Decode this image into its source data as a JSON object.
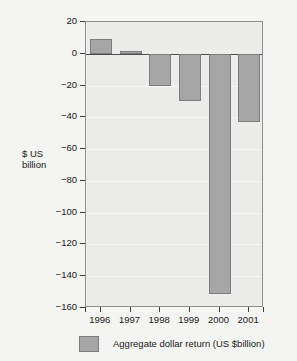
{
  "chart_data": {
    "type": "bar",
    "title": "",
    "xlabel": "",
    "ylabel": "$ US\nbillion",
    "ylabel_line1": "$ US",
    "ylabel_line2": "billion",
    "categories": [
      "1996",
      "1997",
      "1998",
      "1999",
      "2000",
      "2001"
    ],
    "values": [
      9,
      2,
      -20,
      -30,
      -151,
      -43
    ],
    "series": [
      {
        "name": "Aggregate dollar return (US $billion)",
        "values": [
          9,
          2,
          -20,
          -30,
          -151,
          -43
        ]
      }
    ],
    "ylim": [
      -160,
      20
    ],
    "ytick_labels": [
      "20",
      "0",
      "-20",
      "-40",
      "-60",
      "-80",
      "-100",
      "-120",
      "-140",
      "-160"
    ],
    "ytick_values": [
      20,
      0,
      -20,
      -40,
      -60,
      -80,
      -100,
      -120,
      -140,
      -160
    ],
    "grid": true,
    "legend_position": "bottom",
    "legend_entries": [
      "Aggregate dollar return (US $billion)"
    ],
    "bar_color": "#a6a6a6",
    "bar_edge_color": "#7d7d7d",
    "plot_background": "#ececeb",
    "page_background": "#f4f4f2",
    "axis_color": "#3d3d3d"
  },
  "legend": {
    "label": "Aggregate dollar return (US $billion)"
  }
}
